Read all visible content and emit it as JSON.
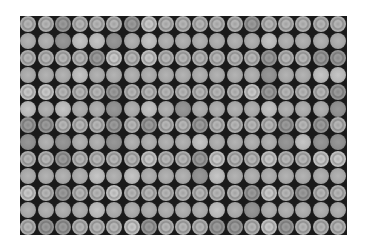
{
  "image": {
    "description": "Grayscale photograph of a dense grid of circular objects (coins or bottle caps) on a dark background",
    "columns": 19,
    "rows": 13,
    "row_pattern": [
      "ring",
      "plain"
    ],
    "colors": {
      "background": "#ffffff",
      "gap": "#1a1a1a",
      "circle": "#a8a8a8"
    }
  }
}
